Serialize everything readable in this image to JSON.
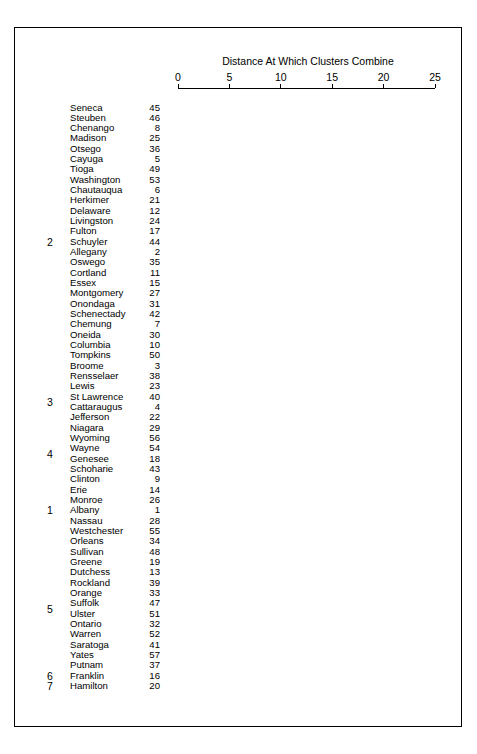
{
  "chart_data": {
    "type": "dendrogram",
    "title": "Distance At Which Clusters Combine",
    "xlabel": "Distance At Which Clusters Combine",
    "ylabel": "",
    "xlim": [
      0,
      25
    ],
    "xticks": [
      0,
      5,
      10,
      15,
      20,
      25
    ],
    "xtick_labels": [
      "0",
      "5",
      "10",
      "15",
      "20",
      "25"
    ],
    "grid": false,
    "legend": null,
    "cut_line": {
      "value": 14.8,
      "style": "dashed",
      "orientation": "vertical"
    },
    "leaves": [
      {
        "label": "Seneca",
        "id": "45",
        "cluster": "2"
      },
      {
        "label": "Steuben",
        "id": "46",
        "cluster": "2"
      },
      {
        "label": "Chenango",
        "id": "8",
        "cluster": "2"
      },
      {
        "label": "Madison",
        "id": "25",
        "cluster": "2"
      },
      {
        "label": "Otsego",
        "id": "36",
        "cluster": "2"
      },
      {
        "label": "Cayuga",
        "id": "5",
        "cluster": "2"
      },
      {
        "label": "Tioga",
        "id": "49",
        "cluster": "2"
      },
      {
        "label": "Washington",
        "id": "53",
        "cluster": "2"
      },
      {
        "label": "Chautauqua",
        "id": "6",
        "cluster": "2"
      },
      {
        "label": "Herkimer",
        "id": "21",
        "cluster": "2"
      },
      {
        "label": "Delaware",
        "id": "12",
        "cluster": "2"
      },
      {
        "label": "Livingston",
        "id": "24",
        "cluster": "2"
      },
      {
        "label": "Fulton",
        "id": "17",
        "cluster": "2"
      },
      {
        "label": "Schuyler",
        "id": "44",
        "cluster": "2"
      },
      {
        "label": "Allegany",
        "id": "2",
        "cluster": "2"
      },
      {
        "label": "Oswego",
        "id": "35",
        "cluster": "2"
      },
      {
        "label": "Cortland",
        "id": "11",
        "cluster": "2"
      },
      {
        "label": "Essex",
        "id": "15",
        "cluster": "2"
      },
      {
        "label": "Montgomery",
        "id": "27",
        "cluster": "2"
      },
      {
        "label": "Onondaga",
        "id": "31",
        "cluster": "2"
      },
      {
        "label": "Schenectady",
        "id": "42",
        "cluster": "2"
      },
      {
        "label": "Chemung",
        "id": "7",
        "cluster": "2"
      },
      {
        "label": "Oneida",
        "id": "30",
        "cluster": "2"
      },
      {
        "label": "Columbia",
        "id": "10",
        "cluster": "2"
      },
      {
        "label": "Tompkins",
        "id": "50",
        "cluster": "2"
      },
      {
        "label": "Broome",
        "id": "3",
        "cluster": "2"
      },
      {
        "label": "Rensselaer",
        "id": "38",
        "cluster": "2"
      },
      {
        "label": "Lewis",
        "id": "23",
        "cluster": "3"
      },
      {
        "label": "St Lawrence",
        "id": "40",
        "cluster": "3"
      },
      {
        "label": "Cattaraugus",
        "id": "4",
        "cluster": "3"
      },
      {
        "label": "Jefferson",
        "id": "22",
        "cluster": "3"
      },
      {
        "label": "Niagara",
        "id": "29",
        "cluster": "4"
      },
      {
        "label": "Wyoming",
        "id": "56",
        "cluster": "4"
      },
      {
        "label": "Wayne",
        "id": "54",
        "cluster": "4"
      },
      {
        "label": "Genesee",
        "id": "18",
        "cluster": "4"
      },
      {
        "label": "Schoharie",
        "id": "43",
        "cluster": "4"
      },
      {
        "label": "Clinton",
        "id": "9",
        "cluster": "4"
      },
      {
        "label": "Erie",
        "id": "14",
        "cluster": "1"
      },
      {
        "label": "Monroe",
        "id": "26",
        "cluster": "1"
      },
      {
        "label": "Albany",
        "id": "1",
        "cluster": "1"
      },
      {
        "label": "Nassau",
        "id": "28",
        "cluster": "1"
      },
      {
        "label": "Westchester",
        "id": "55",
        "cluster": "1"
      },
      {
        "label": "Orleans",
        "id": "34",
        "cluster": "5"
      },
      {
        "label": "Sullivan",
        "id": "48",
        "cluster": "5"
      },
      {
        "label": "Greene",
        "id": "19",
        "cluster": "5"
      },
      {
        "label": "Dutchess",
        "id": "13",
        "cluster": "5"
      },
      {
        "label": "Rockland",
        "id": "39",
        "cluster": "5"
      },
      {
        "label": "Orange",
        "id": "33",
        "cluster": "5"
      },
      {
        "label": "Suffolk",
        "id": "47",
        "cluster": "5"
      },
      {
        "label": "Ulster",
        "id": "51",
        "cluster": "5"
      },
      {
        "label": "Ontario",
        "id": "32",
        "cluster": "5"
      },
      {
        "label": "Warren",
        "id": "52",
        "cluster": "5"
      },
      {
        "label": "Saratoga",
        "id": "41",
        "cluster": "5"
      },
      {
        "label": "Yates",
        "id": "57",
        "cluster": "5"
      },
      {
        "label": "Putnam",
        "id": "37",
        "cluster": "5"
      },
      {
        "label": "Franklin",
        "id": "16",
        "cluster": "6"
      },
      {
        "label": "Hamilton",
        "id": "20",
        "cluster": "7"
      }
    ],
    "cluster_labels": [
      {
        "label": "2",
        "first_leaf": 0,
        "last_leaf": 26
      },
      {
        "label": "3",
        "first_leaf": 27,
        "last_leaf": 30
      },
      {
        "label": "4",
        "first_leaf": 31,
        "last_leaf": 36
      },
      {
        "label": "1",
        "first_leaf": 37,
        "last_leaf": 41
      },
      {
        "label": "5",
        "first_leaf": 42,
        "last_leaf": 55
      },
      {
        "label": "6",
        "first_leaf": 55,
        "last_leaf": 55
      },
      {
        "label": "7",
        "first_leaf": 56,
        "last_leaf": 56
      }
    ],
    "cluster_boundaries_after_leaf": [
      26,
      30,
      36,
      41,
      54,
      55
    ],
    "merges": [
      {
        "left": "leaf:0",
        "right": "leaf:1",
        "height": 1.1
      },
      {
        "left": "leaf:2",
        "right": "leaf:3",
        "height": 1.1
      },
      {
        "left": "node:0",
        "right": "leaf:4",
        "height": 2.4
      },
      {
        "left": "node:1",
        "right": "node:2",
        "height": 3.6
      },
      {
        "left": "leaf:5",
        "right": "leaf:6",
        "height": 5.2
      },
      {
        "left": "node:3",
        "right": "node:4",
        "height": 6.6
      },
      {
        "left": "leaf:7",
        "right": "leaf:8",
        "height": 6.6
      },
      {
        "left": "node:5",
        "right": "node:6",
        "height": 8.7
      },
      {
        "left": "leaf:9",
        "right": "leaf:10",
        "height": 1.3
      },
      {
        "left": "leaf:12",
        "right": "leaf:13",
        "height": 1.2
      },
      {
        "left": "node:8",
        "right": "leaf:11",
        "height": 3.1
      },
      {
        "left": "node:9",
        "right": "leaf:14",
        "height": 3.2
      },
      {
        "left": "node:10",
        "right": "node:11",
        "height": 5.0
      },
      {
        "left": "leaf:15",
        "right": "leaf:16",
        "height": 2.6
      },
      {
        "left": "node:12",
        "right": "node:13",
        "height": 6.4
      },
      {
        "left": "leaf:17",
        "right": "leaf:18",
        "height": 3.9
      },
      {
        "left": "node:14",
        "right": "node:15",
        "height": 8.1
      },
      {
        "left": "node:16",
        "right": "leaf:19",
        "height": 9.2
      },
      {
        "left": "leaf:20",
        "right": "leaf:21",
        "height": 2.0
      },
      {
        "left": "leaf:22",
        "right": "leaf:23",
        "height": 3.4
      },
      {
        "left": "node:18",
        "right": "node:19",
        "height": 6.3
      },
      {
        "left": "leaf:24",
        "right": "leaf:25",
        "height": 5.0
      },
      {
        "left": "node:20",
        "right": "node:21",
        "height": 8.4
      },
      {
        "left": "node:17",
        "right": "node:22",
        "height": 11.4
      },
      {
        "left": "node:23",
        "right": "leaf:26",
        "height": 14.9
      },
      {
        "left": "leaf:27",
        "right": "leaf:28",
        "height": 4.7
      },
      {
        "left": "node:25",
        "right": "leaf:29",
        "height": 8.0
      },
      {
        "left": "node:26",
        "right": "leaf:30",
        "height": 11.2
      },
      {
        "left": "leaf:31",
        "right": "leaf:32",
        "height": 6.7
      },
      {
        "left": "leaf:33",
        "right": "leaf:34",
        "height": 3.3
      },
      {
        "left": "node:29",
        "right": "leaf:35",
        "height": 5.9
      },
      {
        "left": "node:28",
        "right": "node:30",
        "height": 9.0
      },
      {
        "left": "node:31",
        "right": "leaf:36",
        "height": 11.6
      },
      {
        "left": "node:27",
        "right": "node:32",
        "height": 16.0
      },
      {
        "left": "leaf:37",
        "right": "leaf:38",
        "height": 3.5
      },
      {
        "left": "leaf:39",
        "right": "leaf:40",
        "height": 1.2
      },
      {
        "left": "node:35",
        "right": "leaf:41",
        "height": 4.4
      },
      {
        "left": "node:34",
        "right": "node:36",
        "height": 7.5
      },
      {
        "left": "leaf:42",
        "right": "leaf:43",
        "height": 2.6
      },
      {
        "left": "leaf:44",
        "right": "leaf:45",
        "height": 1.5
      },
      {
        "left": "node:39",
        "right": "node:40",
        "height": 5.3
      },
      {
        "left": "leaf:46",
        "right": "leaf:47",
        "height": 3.7
      },
      {
        "left": "node:41",
        "right": "node:42",
        "height": 7.4
      },
      {
        "left": "leaf:48",
        "right": "leaf:49",
        "height": 2.8
      },
      {
        "left": "leaf:50",
        "right": "leaf:51",
        "height": 1.7
      },
      {
        "left": "node:44",
        "right": "node:45",
        "height": 5.6
      },
      {
        "left": "node:43",
        "right": "node:46",
        "height": 9.5
      },
      {
        "left": "node:47",
        "right": "leaf:52",
        "height": 12.9
      },
      {
        "left": "node:38",
        "right": "node:48",
        "height": 17.5
      },
      {
        "left": "node:33",
        "right": "node:49",
        "height": 19.9
      },
      {
        "left": "node:50",
        "right": "leaf:53",
        "height": 23.0
      }
    ]
  }
}
